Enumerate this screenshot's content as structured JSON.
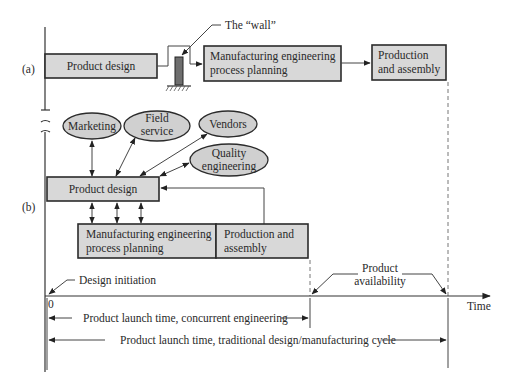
{
  "panel_a": {
    "label": "(a)",
    "product_design": "Product design",
    "wall_label": "The “wall”",
    "mfg_line1": "Manufacturing engineering",
    "mfg_line2": "process planning",
    "prod_line1": "Production",
    "prod_line2": "and assembly"
  },
  "panel_b": {
    "label": "(b)",
    "ellipses": [
      {
        "line1": "Marketing",
        "line2": ""
      },
      {
        "line1": "Field",
        "line2": "service"
      },
      {
        "line1": "Vendors",
        "line2": ""
      },
      {
        "line1": "Quality",
        "line2": "engineering"
      }
    ],
    "product_design": "Product design",
    "mfg_line1": "Manufacturing engineering",
    "mfg_line2": "process planning",
    "prod_line1": "Production and",
    "prod_line2": "assembly"
  },
  "timeline": {
    "design_initiation": "Design initiation",
    "zero": "0",
    "product_availability_line1": "Product",
    "product_availability_line2": "availability",
    "time_label": "Time",
    "concurrent_span": "Product launch time, concurrent engineering",
    "traditional_span": "Product launch time, traditional design/manufacturing cycle"
  },
  "colors": {
    "box_fill": "#d8d8d8",
    "ellipse_fill": "#d0d0d0",
    "wall_fill": "#6e6e6e",
    "stroke": "#2b2b2b"
  }
}
